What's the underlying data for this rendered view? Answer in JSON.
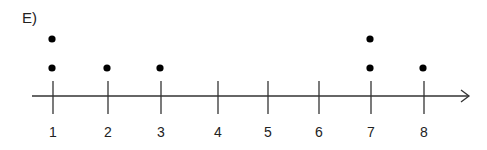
{
  "panel_label": "E)",
  "chart_data": {
    "type": "scatter",
    "subtype": "dot_plot",
    "title": "E)",
    "xlabel": "",
    "ylabel": "",
    "x_ticks": [
      1,
      2,
      3,
      4,
      5,
      6,
      7,
      8
    ],
    "x_tick_labels": [
      "1",
      "2",
      "3",
      "4",
      "5",
      "6",
      "7",
      "8"
    ],
    "xlim": [
      0.6,
      8.9
    ],
    "axis_arrow": "right",
    "grid": false,
    "counts": {
      "1": 2,
      "2": 1,
      "3": 1,
      "4": 0,
      "5": 0,
      "6": 0,
      "7": 2,
      "8": 1
    },
    "points": [
      {
        "x": 1,
        "stack": 1
      },
      {
        "x": 1,
        "stack": 2
      },
      {
        "x": 2,
        "stack": 1
      },
      {
        "x": 3,
        "stack": 1
      },
      {
        "x": 7,
        "stack": 1
      },
      {
        "x": 7,
        "stack": 2
      },
      {
        "x": 8,
        "stack": 1
      }
    ],
    "colors": {
      "dot": "#000000",
      "axis": "#333333"
    }
  }
}
